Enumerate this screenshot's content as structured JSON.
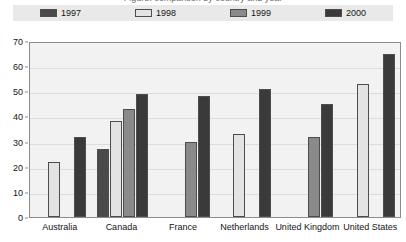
{
  "title_fragment": "Figure: comparison by country and year",
  "legend": {
    "position": "top",
    "entries": [
      {
        "label": "1997",
        "color": "#4a4a4a"
      },
      {
        "label": "1998",
        "color": "#e3e3e3"
      },
      {
        "label": "1999",
        "color": "#8a8a8a"
      },
      {
        "label": "2000",
        "color": "#3a3a3a"
      }
    ]
  },
  "axes": {
    "y_ticks": [
      "0",
      "10",
      "20",
      "30",
      "40",
      "50",
      "60",
      "70"
    ],
    "x_categories": [
      "Australia",
      "Canada",
      "France",
      "Netherlands",
      "United Kingdom",
      "United States"
    ]
  },
  "chart_data": {
    "type": "bar",
    "title": "",
    "xlabel": "",
    "ylabel": "",
    "ylim": [
      0,
      70
    ],
    "ytick_step": 10,
    "grid": true,
    "legend_position": "top",
    "categories": [
      "Australia",
      "Canada",
      "France",
      "Netherlands",
      "United Kingdom",
      "United States"
    ],
    "series": [
      {
        "name": "1997",
        "color": "#4a4a4a",
        "values": [
          null,
          27,
          null,
          null,
          null,
          null
        ]
      },
      {
        "name": "1998",
        "color": "#e3e3e3",
        "values": [
          22,
          38,
          null,
          33,
          null,
          53
        ]
      },
      {
        "name": "1999",
        "color": "#8a8a8a",
        "values": [
          null,
          43,
          30,
          null,
          32,
          null
        ]
      },
      {
        "name": "2000",
        "color": "#3a3a3a",
        "values": [
          32,
          49,
          48,
          51,
          45,
          65
        ]
      }
    ]
  }
}
